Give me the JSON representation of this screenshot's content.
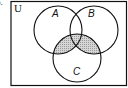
{
  "problem_number_fragment": "b.",
  "diagram": {
    "universe_label": "U",
    "sets": [
      {
        "name": "A",
        "cx": 58,
        "cy": 30,
        "r": 24
      },
      {
        "name": "B",
        "cx": 94,
        "cy": 30,
        "r": 24
      },
      {
        "name": "C",
        "cx": 77,
        "cy": 58,
        "r": 24
      }
    ],
    "shaded_region": "C ∩ (A ∪ B)",
    "shade_color": "#c8c8c8",
    "stroke_color": "#111111"
  }
}
